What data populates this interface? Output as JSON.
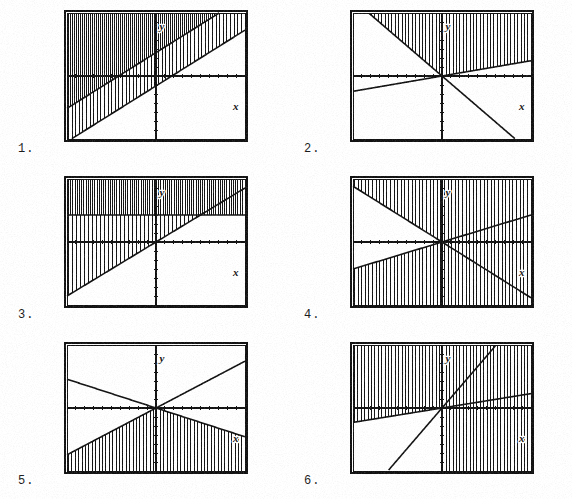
{
  "document": {
    "kind": "math-worksheet",
    "topic": "Graphs of systems of linear inequalities",
    "shading_style": "vertical-line hatching",
    "item_count": 6,
    "page_background": "#ffffff",
    "ink_color": "#111111"
  },
  "axis_labels": {
    "x": "x",
    "y": "y"
  },
  "problems": [
    {
      "number": "1.",
      "name": "problem-1",
      "plot": {
        "xlim": [
          -10,
          10
        ],
        "ylim": [
          -7,
          7
        ],
        "grid": false,
        "ticks": true,
        "x_label": "x",
        "y_label": "y",
        "lines": [
          {
            "name": "line-a",
            "slope": 0.62,
            "intercept": 2.6,
            "style": "solid"
          },
          {
            "name": "line-b",
            "slope": 0.62,
            "intercept": -1.1,
            "style": "solid"
          }
        ],
        "shaded_regions": [
          {
            "name": "above-line-a",
            "description": "region above upper line",
            "density": "very-dense"
          },
          {
            "name": "between-lines",
            "description": "band between the two parallel lines",
            "density": "dense"
          }
        ]
      }
    },
    {
      "number": "2.",
      "name": "problem-2",
      "plot": {
        "xlim": [
          -10,
          10
        ],
        "ylim": [
          -7,
          7
        ],
        "grid": false,
        "ticks": true,
        "x_label": "x",
        "y_label": "y",
        "lines": [
          {
            "name": "line-a",
            "slope": -0.85,
            "intercept": 0.0,
            "style": "solid"
          },
          {
            "name": "line-b",
            "slope": 0.17,
            "intercept": 0.0,
            "style": "solid"
          }
        ],
        "shaded_regions": [
          {
            "name": "above-both-lines",
            "description": "region above both lines through the origin",
            "density": "dense"
          }
        ]
      }
    },
    {
      "number": "3.",
      "name": "problem-3",
      "plot": {
        "xlim": [
          -10,
          10
        ],
        "ylim": [
          -7,
          7
        ],
        "grid": false,
        "ticks": true,
        "x_label": "x",
        "y_label": "y",
        "lines": [
          {
            "name": "line-a",
            "slope": 0.6,
            "intercept": 0.0,
            "style": "solid"
          },
          {
            "name": "horizontal-line",
            "slope": 0.0,
            "intercept": 3.0,
            "style": "solid"
          }
        ],
        "shaded_regions": [
          {
            "name": "above-horizontal",
            "description": "region above y = 3",
            "density": "very-dense"
          },
          {
            "name": "left-of-slanted-below-horizontal",
            "description": "region above the slanted line and below y = 3",
            "density": "dense"
          }
        ]
      }
    },
    {
      "number": "4.",
      "name": "problem-4",
      "plot": {
        "xlim": [
          -10,
          10
        ],
        "ylim": [
          -7,
          7
        ],
        "grid": false,
        "ticks": true,
        "x_label": "x",
        "y_label": "y",
        "lines": [
          {
            "name": "line-a",
            "slope": -0.62,
            "intercept": 0.0,
            "style": "solid"
          },
          {
            "name": "line-b",
            "slope": 0.3,
            "intercept": 0.0,
            "style": "solid"
          }
        ],
        "shaded_regions": [
          {
            "name": "outside-cone",
            "description": "region above the descending line and below the ascending line",
            "density": "dense"
          }
        ]
      }
    },
    {
      "number": "5.",
      "name": "problem-5",
      "plot": {
        "xlim": [
          -10,
          10
        ],
        "ylim": [
          -7,
          7
        ],
        "grid": false,
        "ticks": true,
        "x_label": "x",
        "y_label": "y",
        "lines": [
          {
            "name": "line-a",
            "slope": -0.32,
            "intercept": 0.0,
            "style": "solid"
          },
          {
            "name": "line-b",
            "slope": 0.52,
            "intercept": 0.0,
            "style": "solid"
          }
        ],
        "shaded_regions": [
          {
            "name": "below-both-lines",
            "description": "region below both lines through the origin",
            "density": "dense"
          }
        ]
      }
    },
    {
      "number": "6.",
      "name": "problem-6",
      "plot": {
        "xlim": [
          -10,
          10
        ],
        "ylim": [
          -7,
          7
        ],
        "grid": false,
        "ticks": true,
        "x_label": "x",
        "y_label": "y",
        "lines": [
          {
            "name": "line-a",
            "slope": 1.15,
            "intercept": 0.0,
            "style": "solid"
          },
          {
            "name": "line-b",
            "slope": 0.16,
            "intercept": 0.0,
            "style": "solid"
          }
        ],
        "shaded_regions": [
          {
            "name": "upper-left-wedge",
            "description": "region above the shallow line on the left of the steep line",
            "density": "dense"
          },
          {
            "name": "lower-right-wedge",
            "description": "region below the steep line on the right of the y-axis",
            "density": "dense"
          }
        ]
      }
    }
  ]
}
